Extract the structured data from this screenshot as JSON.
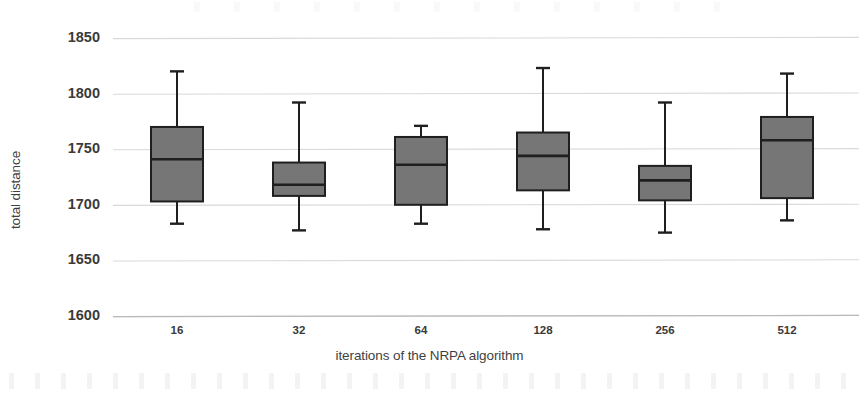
{
  "chart_data": {
    "type": "box",
    "title": "",
    "xlabel": "iterations of the NRPA algorithm",
    "ylabel": "total distance",
    "ylim": [
      1600,
      1850
    ],
    "yticks": [
      1600,
      1650,
      1700,
      1750,
      1800,
      1850
    ],
    "ytick_labels": [
      "1600",
      "1650",
      "1700",
      "1750",
      "1800",
      "1850"
    ],
    "categories": [
      "16",
      "32",
      "64",
      "128",
      "256",
      "512"
    ],
    "grid": "horizontal",
    "legend": "none",
    "box_fill_color": "#767676",
    "box_edge_color": "#1f1f1f",
    "gridline_color": "#d9d9d9",
    "boxes": [
      {
        "category": "16",
        "whisker_low": 1683,
        "q1": 1703,
        "median": 1741,
        "q3": 1770,
        "whisker_high": 1820
      },
      {
        "category": "32",
        "whisker_low": 1677,
        "q1": 1708,
        "median": 1718,
        "q3": 1738,
        "whisker_high": 1792
      },
      {
        "category": "64",
        "whisker_low": 1683,
        "q1": 1700,
        "median": 1736,
        "q3": 1761,
        "whisker_high": 1771
      },
      {
        "category": "128",
        "whisker_low": 1678,
        "q1": 1713,
        "median": 1744,
        "q3": 1765,
        "whisker_high": 1823
      },
      {
        "category": "256",
        "whisker_low": 1675,
        "q1": 1704,
        "median": 1722,
        "q3": 1735,
        "whisker_high": 1792
      },
      {
        "category": "512",
        "whisker_low": 1686,
        "q1": 1706,
        "median": 1758,
        "q3": 1779,
        "whisker_high": 1818
      }
    ]
  },
  "axis": {
    "y_title": "total distance",
    "x_title": "iterations of the NRPA algorithm"
  }
}
